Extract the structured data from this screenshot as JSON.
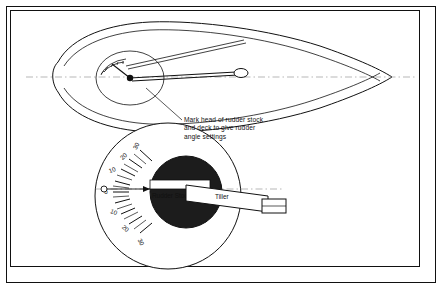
{
  "figure": {
    "title_note": "Mark head of rudder stock\nand deck to give rudder\nangle settings",
    "labels": {
      "rudder_stock": "Rudder Stock",
      "tiller": "Tiller"
    },
    "protractor": {
      "ticks": [
        "30",
        "20",
        "10",
        "0",
        "10",
        "20",
        "30"
      ],
      "unit": "degrees"
    },
    "small_dial": {
      "ticks": [
        "",
        "",
        "",
        "",
        ""
      ]
    },
    "colors": {
      "ink": "#111111",
      "hull_fill": "#ffffff",
      "disc_fill": "#1a1a1a",
      "deck_fill": "#ffffff",
      "centerline": "#888888"
    }
  }
}
